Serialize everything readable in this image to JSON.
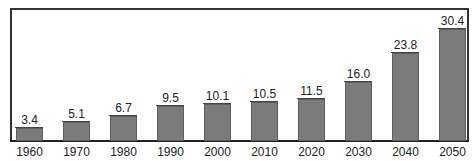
{
  "chart_data": {
    "type": "bar",
    "title": "",
    "xlabel": "",
    "ylabel": "",
    "categories": [
      "1960",
      "1970",
      "1980",
      "1990",
      "2000",
      "2010",
      "2020",
      "2030",
      "2040",
      "2050"
    ],
    "values": [
      3.4,
      5.1,
      6.7,
      9.5,
      10.1,
      10.5,
      11.5,
      16.0,
      23.8,
      30.4
    ],
    "value_labels": [
      "3.4",
      "5.1",
      "6.7",
      "9.5",
      "10.1",
      "10.5",
      "11.5",
      "16.0",
      "23.8",
      "30.4"
    ],
    "ylim": [
      0,
      35
    ],
    "grid": false,
    "legend": null,
    "bar_color": "#7b7b7b"
  }
}
